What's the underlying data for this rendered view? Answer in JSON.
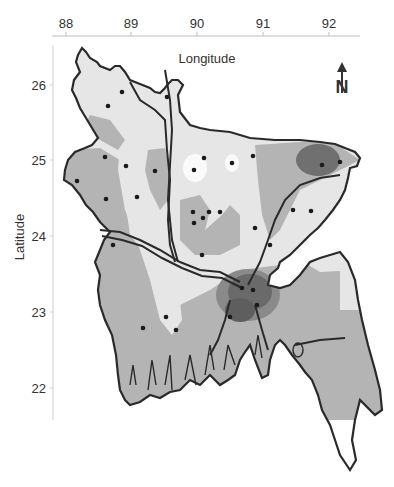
{
  "map": {
    "region": "Bangladesh",
    "x_axis": {
      "title": "Longitude",
      "position": "top",
      "ticks": [
        {
          "label": "88",
          "x": 66
        },
        {
          "label": "89",
          "x": 131
        },
        {
          "label": "90",
          "x": 197
        },
        {
          "label": "91",
          "x": 263
        },
        {
          "label": "92",
          "x": 329
        }
      ]
    },
    "y_axis": {
      "title": "Latitude",
      "position": "left",
      "ticks": [
        {
          "label": "26",
          "y": 85
        },
        {
          "label": "25",
          "y": 160
        },
        {
          "label": "24",
          "y": 236
        },
        {
          "label": "23",
          "y": 312
        },
        {
          "label": "22",
          "y": 388
        }
      ]
    },
    "north_arrow": {
      "label": "N",
      "icon": "north-arrow-icon"
    },
    "shading_levels": [
      {
        "level": "white",
        "color": "#ffffff"
      },
      {
        "level": "very-light",
        "color": "#e6e6e6"
      },
      {
        "level": "light",
        "color": "#b4b4b4"
      },
      {
        "level": "medium",
        "color": "#8a8a8a"
      },
      {
        "level": "dark",
        "color": "#5e5e5e"
      }
    ],
    "boundary_color": "#2a2a2a",
    "station_color": "#1a1a1a"
  }
}
